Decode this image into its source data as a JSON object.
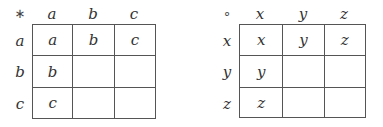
{
  "tables": [
    {
      "operator": "∗",
      "col_headers": [
        "a",
        "b",
        "c"
      ],
      "row_headers": [
        "a",
        "b",
        "c"
      ],
      "cells": [
        [
          "a",
          "b",
          "c"
        ],
        [
          "b",
          "",
          ""
        ],
        [
          "c",
          "",
          ""
        ]
      ]
    },
    {
      "operator": "∘",
      "col_headers": [
        "x",
        "y",
        "z"
      ],
      "row_headers": [
        "x",
        "y",
        "z"
      ],
      "cells": [
        [
          "x",
          "y",
          "z"
        ],
        [
          "y",
          "",
          ""
        ],
        [
          "z",
          "",
          ""
        ]
      ]
    }
  ],
  "colors": {
    "grid_line": "#555555",
    "text": "#333333",
    "background": "#ffffff"
  }
}
